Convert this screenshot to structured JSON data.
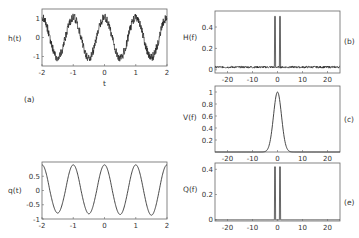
{
  "chart_data": [
    {
      "id": "a",
      "panel_label": "(a)",
      "type": "line",
      "title": "",
      "xlabel": "t",
      "ylabel": "h(t)",
      "xlim": [
        -2,
        2
      ],
      "ylim": [
        -1.5,
        1.5
      ],
      "xticks": [
        -2,
        -1,
        0,
        1,
        2
      ],
      "yticks": [
        -1,
        0,
        1
      ],
      "description": "Noisy cosine-like signal with period ~1, amplitude ~1.2, plus high-frequency jitter",
      "series": [
        {
          "name": "h(t)",
          "model": "cos(2*pi*t) + noise",
          "amplitude": 1.1
        }
      ]
    },
    {
      "id": "b",
      "panel_label": "(b)",
      "type": "line",
      "xlabel": "",
      "ylabel": "H(f)",
      "xlim": [
        -25,
        25
      ],
      "ylim": [
        -0.03,
        0.55
      ],
      "xticks": [
        -20,
        -10,
        0,
        10,
        20
      ],
      "yticks": [
        0,
        0.2,
        0.4
      ],
      "series": [
        {
          "name": "H(f)",
          "peaks": [
            {
              "f": -1,
              "value": 0.5
            },
            {
              "f": 1,
              "value": 0.5
            }
          ],
          "noise_floor": 0.02
        }
      ]
    },
    {
      "id": "c",
      "panel_label": "(c)",
      "type": "line",
      "xlabel": "",
      "ylabel": "V(f)",
      "xlim": [
        -25,
        25
      ],
      "ylim": [
        0,
        1.1
      ],
      "xticks": [
        -20,
        -10,
        0,
        10,
        20
      ],
      "yticks": [
        0.2,
        0.4,
        0.6,
        0.8,
        1
      ],
      "series": [
        {
          "name": "V(f)",
          "model": "gaussian",
          "center": 0,
          "peak": 1.0,
          "sigma": 1.6
        }
      ]
    },
    {
      "id": "q",
      "panel_label": "",
      "type": "line",
      "xlabel": "",
      "ylabel": "q(t)",
      "xlim": [
        -2,
        2
      ],
      "ylim": [
        -1,
        1
      ],
      "xticks": [
        -2,
        -1,
        0,
        1,
        2
      ],
      "yticks": [
        -1,
        -0.5,
        0,
        0.5
      ],
      "series": [
        {
          "name": "q(t)",
          "model": "smooth cosine, period 1",
          "max": 0.9,
          "min": -0.85
        }
      ]
    },
    {
      "id": "e",
      "panel_label": "(e)",
      "type": "line",
      "xlabel": "",
      "ylabel": "Q(f)",
      "xlim": [
        -25,
        25
      ],
      "ylim": [
        -0.01,
        0.45
      ],
      "xticks": [
        -20,
        -10,
        0,
        10,
        20
      ],
      "yticks": [
        0,
        0.2,
        0.4
      ],
      "series": [
        {
          "name": "Q(f)",
          "peaks": [
            {
              "f": -1,
              "value": 0.42
            },
            {
              "f": 1,
              "value": 0.42
            }
          ],
          "noise_floor": 0.0
        }
      ]
    }
  ],
  "labels": {
    "a": {
      "ylabel": "h(t)",
      "xlabel": "t",
      "panel": "(a)"
    },
    "b": {
      "ylabel": "H(f)",
      "panel": "(b)"
    },
    "c": {
      "ylabel": "V(f)",
      "panel": "(c)"
    },
    "q": {
      "ylabel": "q(t)"
    },
    "e": {
      "ylabel": "Q(f)",
      "panel": "(e)"
    }
  }
}
